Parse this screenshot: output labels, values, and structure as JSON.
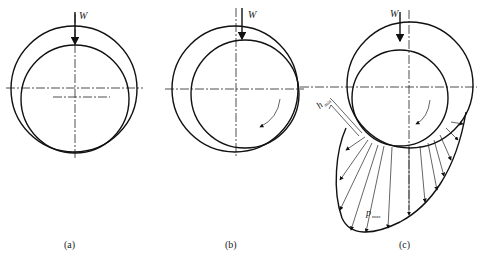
{
  "figure": {
    "panels": [
      {
        "id": "a",
        "caption": "(a)",
        "load_label": "W",
        "state": "at rest"
      },
      {
        "id": "b",
        "caption": "(b)",
        "load_label": "W",
        "state": "start of rotation"
      },
      {
        "id": "c",
        "caption": "(c)",
        "load_label": "W",
        "state": "hydrodynamic lubrication",
        "min_film_label": "h",
        "min_film_sub": "min",
        "max_pressure_label": "p",
        "max_pressure_sub": "max"
      }
    ],
    "colors": {
      "line": "#111111",
      "background": "#ffffff"
    }
  }
}
